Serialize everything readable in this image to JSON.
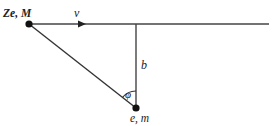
{
  "diagram": {
    "labels": {
      "heavy_particle": "Ze, M",
      "velocity": "v",
      "impact_parameter": "b",
      "angle": "φ",
      "light_particle": "e, m"
    },
    "colors": {
      "line": "#333333",
      "dot": "#111111"
    }
  }
}
